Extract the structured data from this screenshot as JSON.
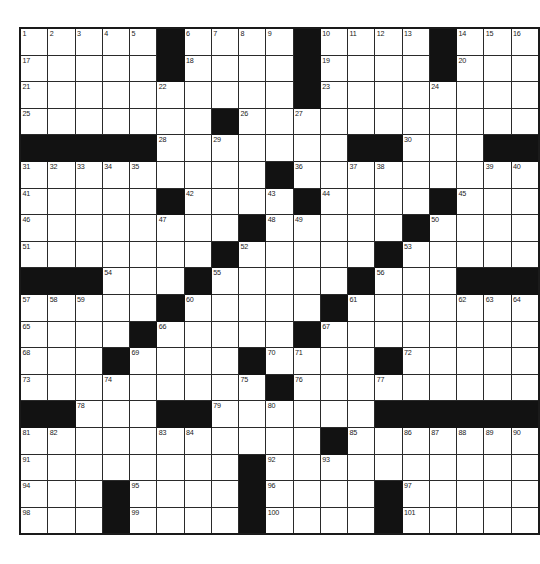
{
  "puzzle": {
    "kind": "crossword-grid",
    "title": "",
    "rows": 19,
    "cols": 17,
    "colors": {
      "block": "#121212",
      "cell": "#ffffff",
      "grid_line": "#2a2a2a",
      "border": "#1a1a1a",
      "number_text": "#1a1a1a",
      "page_background": "#ffffff"
    },
    "max_clue_number": 101,
    "grid": [
      [
        {
          "n": "1"
        },
        {
          "n": "2"
        },
        {
          "n": "3"
        },
        {
          "n": "4"
        },
        {
          "n": "5"
        },
        {
          "b": true
        },
        {
          "n": "6"
        },
        {
          "n": "7"
        },
        {
          "n": "8"
        },
        {
          "n": "9"
        },
        {
          "b": true
        },
        {
          "n": "10"
        },
        {
          "n": "11"
        },
        {
          "n": "12"
        },
        {
          "n": "13"
        },
        {
          "b": true
        },
        {
          "n": "14"
        },
        {
          "n": "15"
        },
        {
          "n": "16"
        }
      ],
      [
        {
          "n": "17"
        },
        {},
        {},
        {},
        {},
        {
          "b": true
        },
        {
          "n": "18"
        },
        {},
        {},
        {},
        {
          "b": true
        },
        {
          "n": "19"
        },
        {},
        {},
        {},
        {
          "b": true
        },
        {
          "n": "20"
        },
        {},
        {}
      ],
      [
        {
          "n": "21"
        },
        {},
        {},
        {},
        {},
        {
          "n": "22"
        },
        {},
        {},
        {},
        {},
        {
          "b": true
        },
        {
          "n": "23"
        },
        {},
        {},
        {},
        {
          "n": "24"
        },
        {},
        {},
        {}
      ],
      [
        {
          "n": "25"
        },
        {},
        {},
        {},
        {},
        {},
        {},
        {
          "b": true
        },
        {
          "n": "26"
        },
        {},
        {
          "n": "27"
        },
        {},
        {},
        {},
        {},
        {},
        {},
        {},
        {}
      ],
      [
        {
          "b": true
        },
        {
          "b": true
        },
        {
          "b": true
        },
        {
          "b": true
        },
        {
          "b": true
        },
        {
          "n": "28"
        },
        {},
        {
          "n": "29"
        },
        {},
        {},
        {},
        {},
        {
          "b": true
        },
        {
          "b": true
        },
        {
          "n": "30"
        },
        {},
        {},
        {
          "b": true
        },
        {
          "b": true
        }
      ],
      [
        {
          "n": "31"
        },
        {
          "n": "32"
        },
        {
          "n": "33"
        },
        {
          "n": "34"
        },
        {
          "n": "35"
        },
        {},
        {},
        {},
        {},
        {
          "b": true
        },
        {
          "n": "36"
        },
        {},
        {
          "n": "37"
        },
        {
          "n": "38"
        },
        {},
        {},
        {},
        {
          "n": "39"
        },
        {
          "n": "40"
        }
      ],
      [
        {
          "n": "41"
        },
        {},
        {},
        {},
        {},
        {
          "b": true
        },
        {
          "n": "42"
        },
        {},
        {},
        {
          "n": "43"
        },
        {
          "b": true
        },
        {
          "n": "44"
        },
        {},
        {},
        {},
        {
          "b": true
        },
        {
          "n": "45"
        },
        {},
        {}
      ],
      [
        {
          "n": "46"
        },
        {},
        {},
        {},
        {},
        {
          "n": "47"
        },
        {},
        {},
        {
          "b": true
        },
        {
          "n": "48"
        },
        {
          "n": "49"
        },
        {},
        {},
        {},
        {
          "b": true
        },
        {
          "n": "50"
        },
        {},
        {},
        {}
      ],
      [
        {
          "n": "51"
        },
        {},
        {},
        {},
        {},
        {},
        {},
        {
          "b": true
        },
        {
          "n": "52"
        },
        {},
        {},
        {},
        {},
        {
          "b": true
        },
        {
          "n": "53"
        },
        {},
        {},
        {},
        {}
      ],
      [
        {
          "b": true
        },
        {
          "b": true
        },
        {
          "b": true
        },
        {
          "n": "54"
        },
        {},
        {},
        {
          "b": true
        },
        {
          "n": "55"
        },
        {},
        {},
        {},
        {},
        {
          "b": true
        },
        {
          "n": "56"
        },
        {},
        {},
        {
          "b": true
        },
        {
          "b": true
        },
        {
          "b": true
        }
      ],
      [
        {
          "n": "57"
        },
        {
          "n": "58"
        },
        {
          "n": "59"
        },
        {},
        {},
        {
          "b": true
        },
        {
          "n": "60"
        },
        {},
        {},
        {},
        {},
        {
          "b": true
        },
        {
          "n": "61"
        },
        {},
        {},
        {},
        {
          "n": "62"
        },
        {
          "n": "63"
        },
        {
          "n": "64"
        }
      ],
      [
        {
          "n": "65"
        },
        {},
        {},
        {},
        {
          "b": true
        },
        {
          "n": "66"
        },
        {},
        {},
        {},
        {},
        {
          "b": true
        },
        {
          "n": "67"
        },
        {},
        {},
        {},
        {},
        {},
        {},
        {}
      ],
      [
        {
          "n": "68"
        },
        {},
        {},
        {
          "b": true
        },
        {
          "n": "69"
        },
        {},
        {},
        {},
        {
          "b": true
        },
        {
          "n": "70"
        },
        {
          "n": "71"
        },
        {},
        {},
        {
          "b": true
        },
        {
          "n": "72"
        },
        {},
        {},
        {},
        {}
      ],
      [
        {
          "n": "73"
        },
        {},
        {},
        {
          "n": "74"
        },
        {},
        {},
        {},
        {},
        {
          "n": "75"
        },
        {
          "b": true
        },
        {
          "n": "76"
        },
        {},
        {},
        {
          "n": "77"
        },
        {},
        {},
        {},
        {},
        {}
      ],
      [
        {
          "b": true
        },
        {
          "b": true
        },
        {
          "n": "78"
        },
        {},
        {},
        {
          "b": true
        },
        {
          "b": true
        },
        {
          "n": "79"
        },
        {},
        {
          "n": "80"
        },
        {},
        {},
        {},
        {
          "b": true
        },
        {
          "b": true
        },
        {
          "b": true
        },
        {
          "b": true
        },
        {
          "b": true
        },
        {
          "b": true
        }
      ],
      [
        {
          "n": "81"
        },
        {
          "n": "82"
        },
        {},
        {},
        {},
        {
          "n": "83"
        },
        {
          "n": "84"
        },
        {},
        {},
        {},
        {},
        {
          "b": true
        },
        {
          "n": "85"
        },
        {},
        {
          "n": "86"
        },
        {
          "n": "87"
        },
        {
          "n": "88"
        },
        {
          "n": "89"
        },
        {
          "n": "90"
        }
      ],
      [
        {
          "n": "91"
        },
        {},
        {},
        {},
        {},
        {},
        {},
        {},
        {
          "b": true
        },
        {
          "n": "92"
        },
        {},
        {
          "n": "93"
        },
        {},
        {},
        {},
        {},
        {},
        {},
        {}
      ],
      [
        {
          "n": "94"
        },
        {},
        {},
        {
          "b": true
        },
        {
          "n": "95"
        },
        {},
        {},
        {},
        {
          "b": true
        },
        {
          "n": "96"
        },
        {},
        {},
        {},
        {
          "b": true
        },
        {
          "n": "97"
        },
        {},
        {},
        {},
        {}
      ],
      [
        {
          "n": "98"
        },
        {},
        {},
        {
          "b": true
        },
        {
          "n": "99"
        },
        {},
        {},
        {},
        {
          "b": true
        },
        {
          "n": "100"
        },
        {},
        {},
        {},
        {
          "b": true
        },
        {
          "n": "101"
        },
        {},
        {},
        {},
        {}
      ]
    ]
  }
}
